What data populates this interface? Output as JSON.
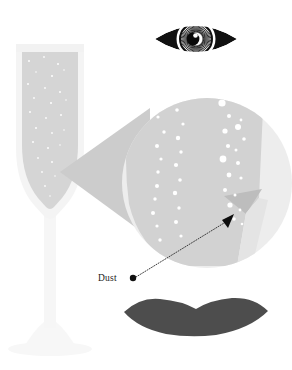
{
  "figure": {
    "width": 292,
    "height": 370,
    "background_color": "#ffffff"
  },
  "annotations": [
    {
      "id": "dust-label",
      "label": "Dust",
      "bullet": "filled-dot",
      "bullet_color": "#111111",
      "label_x": 98,
      "label_y": 281,
      "bullet_x": 133,
      "bullet_y": 278,
      "leader_line": {
        "style": "dotted",
        "color": "#3a3a3a",
        "from_x": 136,
        "from_y": 277,
        "to_x": 229,
        "to_y": 220
      },
      "arrow_head": {
        "color": "#0d0d0d",
        "tip_x": 234,
        "tip_y": 216
      }
    }
  ],
  "objects": {
    "glass": {
      "name": "champagne-flute",
      "body_color": "#f4f4f4",
      "liquid_color": "#d5d5d5",
      "bubble_color": "#fdfdfd",
      "stem_color": "#f6f6f6",
      "base_color": "#f6f6f6"
    },
    "magnifier": {
      "name": "magnified-circle",
      "ring_color": "#ededed",
      "liquid_color": "#d2d2d2",
      "bubble_color": "#ffffff",
      "wedge_color": "#bdbdbd",
      "center_x": 207,
      "center_y": 183,
      "radius": 85
    },
    "cone": {
      "name": "magnification-cone",
      "color": "#cccccc",
      "apex_x": 60,
      "apex_y": 172
    },
    "eye": {
      "name": "eye-illustration",
      "outline_color": "#111111",
      "sclera_color": "#ffffff",
      "iris_color": "#1a1a1a",
      "pupil_color": "#0a0a0a",
      "highlight_color": "#ffffff",
      "center_x": 196,
      "center_y": 39,
      "half_width": 41,
      "half_height": 21,
      "iris_radius": 16,
      "iris_spokes": 64
    },
    "lips": {
      "name": "lips-illustration",
      "color": "#4d4d4d",
      "left_x": 124,
      "right_x": 268,
      "top_y": 297,
      "bottom_y": 336
    }
  },
  "bubbles": {
    "glass_stream": [
      {
        "x": 29,
        "y": 61,
        "r": 1.0
      },
      {
        "x": 44,
        "y": 57,
        "r": 0.9
      },
      {
        "x": 58,
        "y": 64,
        "r": 1.0
      },
      {
        "x": 36,
        "y": 72,
        "r": 0.8
      },
      {
        "x": 52,
        "y": 76,
        "r": 1.1
      },
      {
        "x": 64,
        "y": 70,
        "r": 0.8
      },
      {
        "x": 28,
        "y": 84,
        "r": 1.0
      },
      {
        "x": 45,
        "y": 88,
        "r": 0.9
      },
      {
        "x": 60,
        "y": 92,
        "r": 1.0
      },
      {
        "x": 34,
        "y": 98,
        "r": 0.9
      },
      {
        "x": 51,
        "y": 103,
        "r": 1.1
      },
      {
        "x": 66,
        "y": 100,
        "r": 0.8
      },
      {
        "x": 30,
        "y": 112,
        "r": 1.0
      },
      {
        "x": 46,
        "y": 118,
        "r": 0.9
      },
      {
        "x": 61,
        "y": 115,
        "r": 1.0
      },
      {
        "x": 36,
        "y": 128,
        "r": 1.0
      },
      {
        "x": 52,
        "y": 133,
        "r": 0.9
      },
      {
        "x": 64,
        "y": 130,
        "r": 0.8
      },
      {
        "x": 33,
        "y": 142,
        "r": 1.0
      },
      {
        "x": 48,
        "y": 148,
        "r": 1.0
      },
      {
        "x": 60,
        "y": 145,
        "r": 0.8
      },
      {
        "x": 38,
        "y": 158,
        "r": 0.9
      },
      {
        "x": 52,
        "y": 162,
        "r": 1.0
      },
      {
        "x": 42,
        "y": 172,
        "r": 0.9
      },
      {
        "x": 55,
        "y": 176,
        "r": 0.8
      },
      {
        "x": 45,
        "y": 186,
        "r": 0.9
      },
      {
        "x": 50,
        "y": 196,
        "r": 0.8
      }
    ],
    "magnified_left_stream": [
      {
        "x": 158,
        "y": 117,
        "r": 1.6
      },
      {
        "x": 164,
        "y": 132,
        "r": 1.7
      },
      {
        "x": 157,
        "y": 146,
        "r": 2.0
      },
      {
        "x": 161,
        "y": 159,
        "r": 1.6
      },
      {
        "x": 158,
        "y": 172,
        "r": 1.7
      },
      {
        "x": 157,
        "y": 186,
        "r": 2.0
      },
      {
        "x": 155,
        "y": 199,
        "r": 1.7
      },
      {
        "x": 153,
        "y": 213,
        "r": 2.0
      },
      {
        "x": 157,
        "y": 226,
        "r": 1.6
      },
      {
        "x": 160,
        "y": 240,
        "r": 1.7
      }
    ],
    "magnified_mid_stream": [
      {
        "x": 177,
        "y": 110,
        "r": 1.8
      },
      {
        "x": 183,
        "y": 124,
        "r": 1.6
      },
      {
        "x": 178,
        "y": 138,
        "r": 2.2
      },
      {
        "x": 181,
        "y": 152,
        "r": 1.7
      },
      {
        "x": 176,
        "y": 165,
        "r": 2.1
      },
      {
        "x": 180,
        "y": 180,
        "r": 1.8
      },
      {
        "x": 175,
        "y": 193,
        "r": 2.2
      },
      {
        "x": 179,
        "y": 208,
        "r": 1.7
      },
      {
        "x": 176,
        "y": 222,
        "r": 2.0
      },
      {
        "x": 181,
        "y": 236,
        "r": 1.6
      }
    ],
    "magnified_right_stream": [
      {
        "x": 222,
        "y": 103,
        "r": 3.6
      },
      {
        "x": 234,
        "y": 99,
        "r": 1.6
      },
      {
        "x": 229,
        "y": 116,
        "r": 2.0
      },
      {
        "x": 241,
        "y": 120,
        "r": 1.4
      },
      {
        "x": 225,
        "y": 131,
        "r": 2.6
      },
      {
        "x": 238,
        "y": 127,
        "r": 3.0
      },
      {
        "x": 244,
        "y": 139,
        "r": 1.8
      },
      {
        "x": 228,
        "y": 146,
        "r": 2.1
      },
      {
        "x": 236,
        "y": 150,
        "r": 1.5
      },
      {
        "x": 223,
        "y": 159,
        "r": 3.4
      },
      {
        "x": 238,
        "y": 163,
        "r": 2.0
      },
      {
        "x": 229,
        "y": 175,
        "r": 2.4
      },
      {
        "x": 241,
        "y": 178,
        "r": 1.6
      },
      {
        "x": 225,
        "y": 190,
        "r": 2.0
      },
      {
        "x": 235,
        "y": 195,
        "r": 1.5
      },
      {
        "x": 230,
        "y": 205,
        "r": 2.6
      },
      {
        "x": 240,
        "y": 210,
        "r": 1.4
      },
      {
        "x": 234,
        "y": 219,
        "r": 1.8
      },
      {
        "x": 242,
        "y": 224,
        "r": 1.3
      }
    ]
  }
}
